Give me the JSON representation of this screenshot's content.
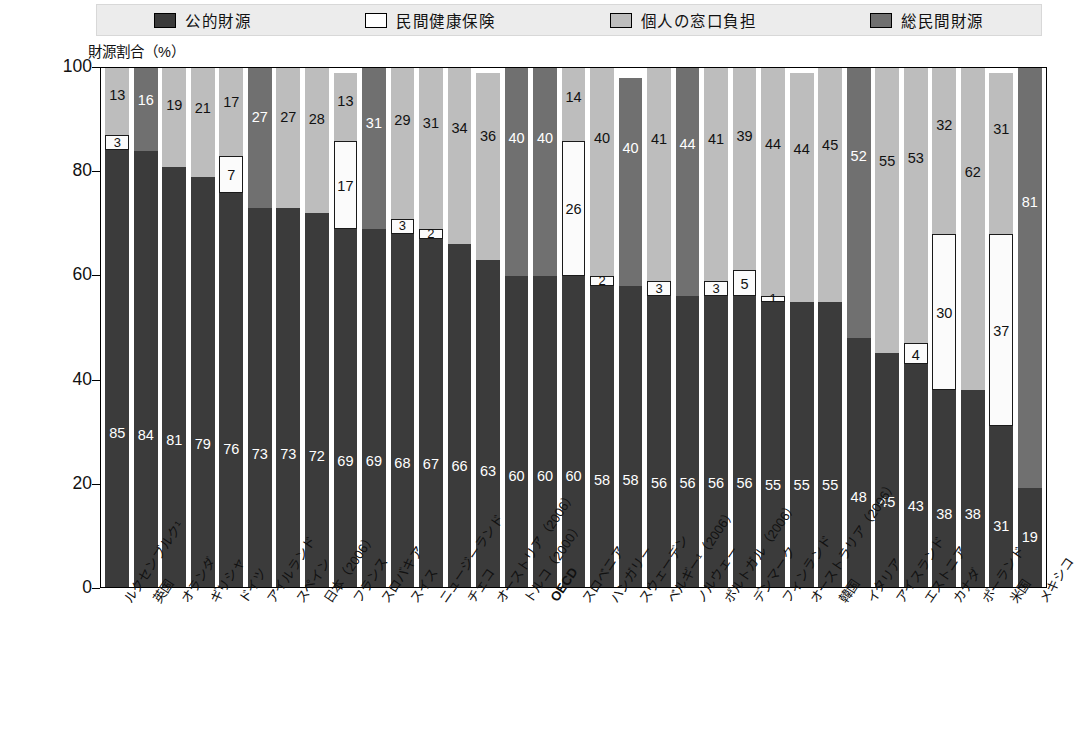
{
  "legend": {
    "items": [
      {
        "key": "public",
        "label": "公的財源",
        "color": "#3b3b3b",
        "icon": "legend-swatch-public"
      },
      {
        "key": "pinsurance",
        "label": "民間健康保険",
        "color": "#ffffff",
        "icon": "legend-swatch-private-insurance"
      },
      {
        "key": "oop",
        "label": "個人の窓口負担",
        "color": "#bdbdbd",
        "icon": "legend-swatch-out-of-pocket"
      },
      {
        "key": "totalprivate",
        "label": "総民間財源",
        "color": "#707070",
        "icon": "legend-swatch-total-private"
      }
    ]
  },
  "axis": {
    "y_title": "財源割合（%）",
    "ticks": [
      "100",
      "80",
      "60",
      "40",
      "20",
      "0"
    ]
  },
  "chart_data": {
    "type": "bar",
    "title": "",
    "subtitle": "",
    "xlabel": "",
    "ylabel": "財源割合（%）",
    "ylim": [
      0,
      100
    ],
    "yticks": [
      0,
      20,
      40,
      60,
      80,
      100
    ],
    "grid": false,
    "stacked": true,
    "legend_position": "top",
    "series": [
      {
        "name": "公的財源",
        "key": "public",
        "color": "#3b3b3b"
      },
      {
        "name": "民間健康保険",
        "key": "pinsurance",
        "color": "#ffffff"
      },
      {
        "name": "個人の窓口負担",
        "key": "oop",
        "color": "#bdbdbd"
      },
      {
        "name": "総民間財源",
        "key": "totalprivate",
        "color": "#707070"
      }
    ],
    "categories": [
      "ルクセンブルク¹",
      "英国",
      "オランダ",
      "ギリシャ",
      "ドイツ",
      "アイルランド",
      "スペイン",
      "日本（2006）",
      "フランス",
      "スロバキア",
      "スイス",
      "ニュージーランド",
      "チェコ",
      "オーストリア（2006）",
      "トルコ（2000）",
      "OECD",
      "スロベニア",
      "ハンガリー",
      "スウェーデン",
      "ベルギー¹（2006）",
      "ノルウェー",
      "ポルトガル（2006）",
      "デンマーク",
      "フィンランド",
      "オーストラリア（2006）",
      "韓国",
      "イタリア",
      "アイスランド",
      "エストニア",
      "カナダ",
      "ポーランド",
      "米国",
      "メキシコ"
    ],
    "highlight_category": "OECD",
    "bars": [
      {
        "category": "ルクセンブルク¹",
        "public": 85,
        "pinsurance": 3,
        "oop": 13,
        "totalprivate": 0
      },
      {
        "category": "英国",
        "public": 84,
        "pinsurance": 0,
        "oop": 0,
        "totalprivate": 16
      },
      {
        "category": "オランダ",
        "public": 81,
        "pinsurance": 0,
        "oop": 19,
        "totalprivate": 0
      },
      {
        "category": "ギリシャ",
        "public": 79,
        "pinsurance": 0,
        "oop": 21,
        "totalprivate": 0
      },
      {
        "category": "ドイツ",
        "public": 76,
        "pinsurance": 7,
        "oop": 17,
        "totalprivate": 0
      },
      {
        "category": "アイルランド",
        "public": 73,
        "pinsurance": 0,
        "oop": 0,
        "totalprivate": 27
      },
      {
        "category": "スペイン",
        "public": 73,
        "pinsurance": 0,
        "oop": 27,
        "totalprivate": 0
      },
      {
        "category": "日本（2006）",
        "public": 72,
        "pinsurance": 0,
        "oop": 28,
        "totalprivate": 0
      },
      {
        "category": "フランス",
        "public": 69,
        "pinsurance": 17,
        "oop": 13,
        "totalprivate": 0
      },
      {
        "category": "スロバキア",
        "public": 69,
        "pinsurance": 0,
        "oop": 0,
        "totalprivate": 31
      },
      {
        "category": "スイス",
        "public": 68,
        "pinsurance": 3,
        "oop": 29,
        "totalprivate": 0
      },
      {
        "category": "ニュージーランド",
        "public": 67,
        "pinsurance": 2,
        "oop": 31,
        "totalprivate": 0
      },
      {
        "category": "チェコ",
        "public": 66,
        "pinsurance": 0,
        "oop": 34,
        "totalprivate": 0
      },
      {
        "category": "オーストリア（2006）",
        "public": 63,
        "pinsurance": 0,
        "oop": 36,
        "totalprivate": 0
      },
      {
        "category": "トルコ（2000）",
        "public": 60,
        "pinsurance": 0,
        "oop": 0,
        "totalprivate": 40
      },
      {
        "category": "OECD",
        "public": 60,
        "pinsurance": 0,
        "oop": 0,
        "totalprivate": 40
      },
      {
        "category": "スロベニア",
        "public": 60,
        "pinsurance": 26,
        "oop": 14,
        "totalprivate": 0
      },
      {
        "category": "ハンガリー",
        "public": 58,
        "pinsurance": 2,
        "oop": 40,
        "totalprivate": 0
      },
      {
        "category": "スウェーデン",
        "public": 58,
        "pinsurance": 0,
        "oop": 0,
        "totalprivate": 40
      },
      {
        "category": "ベルギー¹（2006）",
        "public": 56,
        "pinsurance": 3,
        "oop": 41,
        "totalprivate": 0
      },
      {
        "category": "ノルウェー",
        "public": 56,
        "pinsurance": 0,
        "oop": 0,
        "totalprivate": 44
      },
      {
        "category": "ポルトガル（2006）",
        "public": 56,
        "pinsurance": 3,
        "oop": 41,
        "totalprivate": 0
      },
      {
        "category": "デンマーク",
        "public": 56,
        "pinsurance": 5,
        "oop": 39,
        "totalprivate": 0
      },
      {
        "category": "フィンランド",
        "public": 55,
        "pinsurance": 1,
        "oop": 44,
        "totalprivate": 0
      },
      {
        "category": "オーストラリア（2006）",
        "public": 55,
        "pinsurance": 0,
        "oop": 44,
        "totalprivate": 0
      },
      {
        "category": "韓国",
        "public": 55,
        "pinsurance": 0,
        "oop": 45,
        "totalprivate": 0
      },
      {
        "category": "イタリア",
        "public": 48,
        "pinsurance": 0,
        "oop": 0,
        "totalprivate": 52
      },
      {
        "category": "アイスランド",
        "public": 45,
        "pinsurance": 0,
        "oop": 55,
        "totalprivate": 0
      },
      {
        "category": "エストニア",
        "public": 43,
        "pinsurance": 4,
        "oop": 53,
        "totalprivate": 0
      },
      {
        "category": "カナダ",
        "public": 38,
        "pinsurance": 30,
        "oop": 32,
        "totalprivate": 0
      },
      {
        "category": "ポーランド",
        "public": 38,
        "pinsurance": 0,
        "oop": 62,
        "totalprivate": 0
      },
      {
        "category": "米国",
        "public": 31,
        "pinsurance": 37,
        "oop": 31,
        "totalprivate": 0
      },
      {
        "category": "メキシコ",
        "public": 19,
        "pinsurance": 0,
        "oop": 0,
        "totalprivate": 81
      }
    ],
    "value_labels": {
      "hidden_when_zero": true,
      "notes": "Segment labels are drawn inside each stacked segment; very small segments (1–5) still show their number."
    }
  }
}
